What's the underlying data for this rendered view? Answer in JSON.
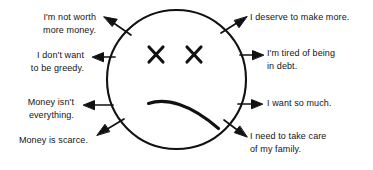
{
  "figure": {
    "face": {
      "expression": "sad-face-with-x-eyes",
      "stroke_color": "#111111",
      "fill_color": "#ffffff"
    },
    "stroke_color": "#111111",
    "background_color": "#ffffff",
    "text_color": "#141414"
  },
  "labels": {
    "left": [
      {
        "id": "not-worth-more-money",
        "text": "I'm not worth\nmore money."
      },
      {
        "id": "dont-want-to-be-greedy",
        "text": "I don't want\nto be greedy."
      },
      {
        "id": "money-isnt-everything",
        "text": "Money isn't\neverything."
      },
      {
        "id": "money-is-scarce",
        "text": "Money is scarce."
      }
    ],
    "right": [
      {
        "id": "deserve-to-make-more",
        "text": "I deserve to make more."
      },
      {
        "id": "tired-of-being-in-debt",
        "text": "I'm tired of being\nin debt."
      },
      {
        "id": "want-so-much",
        "text": "I want so much."
      },
      {
        "id": "take-care-of-my-family",
        "text": "I need to take care\nof my family."
      }
    ]
  }
}
